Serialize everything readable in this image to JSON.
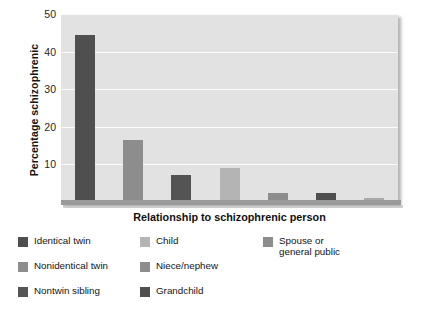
{
  "chart_data": {
    "type": "bar",
    "title": "",
    "xlabel": "Relationship to schizophrenic person",
    "ylabel": "Percentage schizophrenic",
    "ylim": [
      0,
      50
    ],
    "yticks": [
      10,
      20,
      30,
      40,
      50
    ],
    "grid": true,
    "legend_position": "bottom",
    "categories": [
      "Identical twin",
      "Nonidentical twin",
      "Nontwin sibling",
      "Child",
      "Niece/nephew",
      "Grandchild",
      "Spouse or general public"
    ],
    "values": [
      44.3,
      16.5,
      7.2,
      9.0,
      2.5,
      2.5,
      1.0
    ],
    "colors": [
      "#4f4f4f",
      "#8d8d8d",
      "#545454",
      "#b4b4b4",
      "#8d8d8d",
      "#4f4f4f",
      "#a8a8a8"
    ]
  },
  "axes": {
    "y_title": "Percentage schizophrenic",
    "x_title": "Relationship to schizophrenic person",
    "y_tick_labels": [
      "50",
      "40",
      "30",
      "20",
      "10"
    ]
  },
  "legend": {
    "columns": [
      {
        "items": [
          {
            "label": "Identical twin",
            "color": "#4f4f4f"
          },
          {
            "label": "Nonidentical twin",
            "color": "#8d8d8d"
          },
          {
            "label": "Nontwin sibling",
            "color": "#545454"
          }
        ]
      },
      {
        "items": [
          {
            "label": "Child",
            "color": "#b4b4b4"
          },
          {
            "label": "Niece/nephew",
            "color": "#8d8d8d"
          },
          {
            "label": "Grandchild",
            "color": "#4f4f4f"
          }
        ]
      },
      {
        "items": [
          {
            "label": "Spouse or\ngeneral public",
            "color": "#8d8d8d"
          }
        ]
      }
    ]
  },
  "style": {
    "panel_background": "#e2e2e2",
    "gridline_color": "#fbfbfb",
    "axis_color": "#9a9a9a",
    "text_color": "#141414"
  }
}
